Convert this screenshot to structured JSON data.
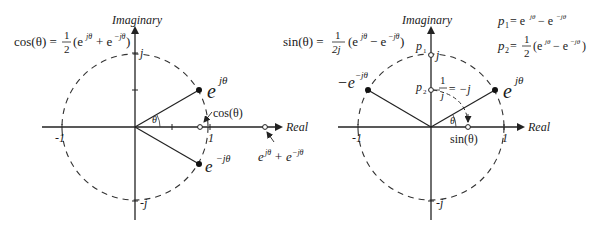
{
  "left_diagram": {
    "axis_labels": {
      "imaginary": "Imaginary",
      "real": "Real"
    },
    "formula": {
      "lhs": "cos(θ) = ",
      "frac_num": "1",
      "frac_den": "2",
      "rhs_open": "(e",
      "exp1": "jθ",
      "mid": " + e",
      "exp2": "−jθ",
      "rhs_close": ")"
    },
    "ticks": {
      "pos_j": "j",
      "neg_j": "-j",
      "neg_one": "-1",
      "pos_one": "1"
    },
    "points": {
      "ejtheta": {
        "base": "e",
        "exp": "jθ"
      },
      "emjtheta": {
        "base": "e",
        "exp": "−jθ"
      },
      "cos": "cos(θ)",
      "sum": {
        "a": "e",
        "a_exp": "jθ",
        "op": " + e",
        "b_exp": "−jθ"
      }
    },
    "angle": "θ"
  },
  "right_diagram": {
    "axis_labels": {
      "imaginary": "Imaginary",
      "real": "Real"
    },
    "formula": {
      "lhs": "sin(θ) = ",
      "frac_num": "1",
      "frac_den": "2j",
      "rhs_open": "(e",
      "exp1": "jθ",
      "mid": " − e",
      "exp2": "−jθ",
      "rhs_close": ")"
    },
    "defs": {
      "p1": {
        "name": "p",
        "sub": "1",
        "eq": " = e",
        "exp1": "jθ",
        "mid": " − e",
        "exp2": "−jθ"
      },
      "p2": {
        "name": "p",
        "sub": "2",
        "eq": " = ",
        "frac_num": "1",
        "frac_den": "2",
        "open": "(e",
        "exp1": "jθ",
        "mid": " − e",
        "exp2": "−jθ",
        "close": ")"
      }
    },
    "ticks": {
      "pos_j": "j",
      "neg_j": "-j",
      "neg_one": "-1",
      "pos_one": "1"
    },
    "points": {
      "p1": {
        "name": "p",
        "sub": "1"
      },
      "p2": {
        "name": "p",
        "sub": "2"
      },
      "inv_j": {
        "num": "1",
        "den": "j",
        "rest": " = −j"
      },
      "ejtheta": {
        "base": "e",
        "exp": "jθ"
      },
      "neg_emjtheta": {
        "base": "−e",
        "exp": "−jθ"
      },
      "sin": "sin(θ)"
    },
    "angle": "θ"
  }
}
